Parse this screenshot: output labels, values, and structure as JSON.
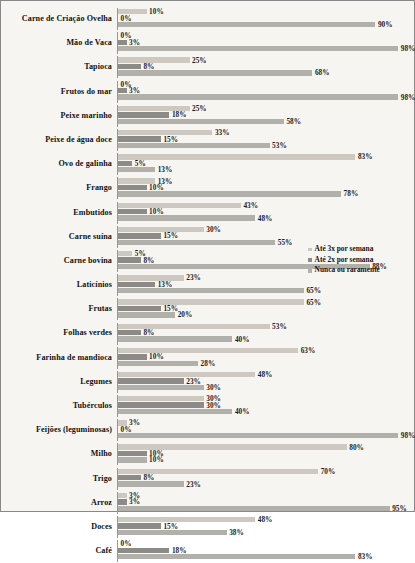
{
  "chart_data": {
    "type": "bar",
    "orientation": "horizontal",
    "title": "",
    "subtitle": "",
    "xlabel": "",
    "ylabel": "",
    "xlim": [
      0,
      100
    ],
    "grid": false,
    "legend_position": "right-middle",
    "unit": "%",
    "categories": [
      "Carne de Criação Ovelha",
      "Mão de Vaca",
      "Tapioca",
      "Frutos do mar",
      "Peixe marinho",
      "Peixe de água doce",
      "Ovo de galinha",
      "Frango",
      "Embutidos",
      "Carne suína",
      "Carne bovina",
      "Laticínios",
      "Frutas",
      "Folhas verdes",
      "Farinha de mandioca",
      "Legumes",
      "Tubérculos",
      "Feijões (leguminosas)",
      "Milho",
      "Trigo",
      "Arroz",
      "Doces",
      "Café"
    ],
    "series": [
      {
        "name": "Até 3x por semana",
        "color": "#cdc9c1",
        "values": [
          10,
          0,
          25,
          0,
          25,
          33,
          83,
          13,
          43,
          30,
          5,
          23,
          65,
          53,
          63,
          48,
          30,
          3,
          80,
          70,
          3,
          48,
          0
        ],
        "labels": [
          "10%",
          "0%",
          "25%",
          "0%",
          "25%",
          "33%",
          "83%",
          "13%",
          "43%",
          "30%",
          "5%",
          "23%",
          "65%",
          "53%",
          "63%",
          "48%",
          "30%",
          "3%",
          "80%",
          "70%",
          "3%",
          "48%",
          "0%"
        ]
      },
      {
        "name": "Até 2x por semana",
        "color": "#8c8b87",
        "values": [
          0,
          3,
          8,
          3,
          18,
          15,
          5,
          10,
          10,
          15,
          8,
          13,
          15,
          8,
          10,
          23,
          30,
          0,
          10,
          8,
          3,
          15,
          18
        ],
        "labels": [
          "0%",
          "3%",
          "8%",
          "3%",
          "18%",
          "15%",
          "5%",
          "10%",
          "10%",
          "15%",
          "8%",
          "13%",
          "15%",
          "8%",
          "10%",
          "23%",
          "30%",
          "0%",
          "10%",
          "8%",
          "3%",
          "15%",
          "18%"
        ]
      },
      {
        "name": "Nunca ou raramente",
        "color": "#b2b0aa",
        "values": [
          90,
          98,
          68,
          98,
          58,
          53,
          13,
          78,
          48,
          55,
          88,
          65,
          20,
          40,
          28,
          30,
          40,
          98,
          10,
          23,
          95,
          38,
          83
        ],
        "labels": [
          "90%",
          "98%",
          "68%",
          "98%",
          "58%",
          "53%",
          "13%",
          "78%",
          "48%",
          "55%",
          "88%",
          "65%",
          "20%",
          "40%",
          "28%",
          "30%",
          "40%",
          "98%",
          "10%",
          "23%",
          "95%",
          "38%",
          "83%"
        ]
      }
    ]
  },
  "legend": {
    "items": [
      {
        "label": "Até 3x por semana",
        "color": "#cdc9c1"
      },
      {
        "label": "Até 2x por semana",
        "color": "#8c8b87"
      },
      {
        "label": "Nunca ou raramente",
        "color": "#b2b0aa"
      }
    ]
  }
}
